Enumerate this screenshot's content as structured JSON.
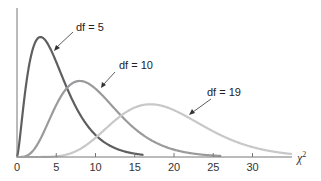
{
  "chart_data": {
    "type": "line",
    "title": "",
    "xlabel": "χ2",
    "ylabel": "",
    "xlim": [
      0,
      35
    ],
    "x_ticks": [
      0,
      5,
      10,
      15,
      20,
      25,
      30
    ],
    "x_tick_labels": [
      "0",
      "5",
      "10",
      "15",
      "20",
      "25",
      "30"
    ],
    "grid": false,
    "legend": "none (inline annotations)",
    "series": [
      {
        "name": "df = 5",
        "df": 5,
        "color": "#5f5f62",
        "mode_x": 3,
        "x_range": [
          0,
          16
        ]
      },
      {
        "name": "df = 10",
        "df": 10,
        "color": "#9a9a9c",
        "mode_x": 8,
        "x_range": [
          0,
          26
        ]
      },
      {
        "name": "df = 19",
        "df": 19,
        "color": "#c8c8c9",
        "mode_x": 17,
        "x_range": [
          0,
          35
        ]
      }
    ],
    "annotations": [
      {
        "text": "df = 5",
        "points_to": "df = 5 curve"
      },
      {
        "text": "df = 10",
        "points_to": "df = 10 curve"
      },
      {
        "text": "df = 19",
        "points_to": "df = 19 curve"
      }
    ]
  },
  "labels": {
    "xlabel_main": "χ",
    "xlabel_sup": "2",
    "ann5": "df = 5",
    "ann10": "df = 10",
    "ann19": "df = 19",
    "ticks": [
      "0",
      "5",
      "10",
      "15",
      "20",
      "25",
      "30"
    ]
  }
}
